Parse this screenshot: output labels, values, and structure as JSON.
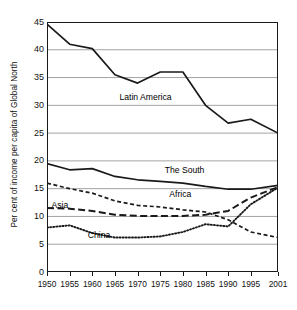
{
  "chart_data": {
    "type": "line",
    "title": "",
    "xlabel": "",
    "ylabel": "Per cent of income per capita of Global North",
    "x": [
      1950,
      1955,
      1960,
      1965,
      1970,
      1975,
      1980,
      1985,
      1990,
      1995,
      2001
    ],
    "xtick_labels": [
      "1950",
      "1955",
      "1960",
      "1965",
      "1970",
      "1975",
      "1980",
      "1985",
      "1990",
      "1995",
      "2001"
    ],
    "ytick_labels": [
      "0",
      "5",
      "10",
      "15",
      "20",
      "25",
      "30",
      "35",
      "40",
      "45"
    ],
    "yticks": [
      0,
      5,
      10,
      15,
      20,
      25,
      30,
      35,
      40,
      45
    ],
    "xlim": [
      1950,
      2001
    ],
    "ylim": [
      0,
      45
    ],
    "grid": "horizontal",
    "legend": "inline-labels",
    "series": [
      {
        "name": "Latin America",
        "style": "solid",
        "label_x": 1966,
        "label_y": 31.5,
        "values": [
          44.6,
          41.0,
          40.2,
          35.5,
          34.0,
          36.0,
          36.0,
          30.0,
          26.8,
          27.5,
          25.0
        ]
      },
      {
        "name": "The South",
        "style": "solid",
        "label_x": 1976,
        "label_y": 18.4,
        "values": [
          19.5,
          18.4,
          18.6,
          17.2,
          16.6,
          16.3,
          16.0,
          15.4,
          14.9,
          14.9,
          15.6
        ]
      },
      {
        "name": "Africa",
        "style": "short-dash",
        "label_x": 1977,
        "label_y": 14.0,
        "values": [
          16.0,
          15.0,
          14.2,
          12.8,
          12.0,
          11.7,
          11.2,
          10.8,
          9.4,
          7.2,
          6.2
        ]
      },
      {
        "name": "Asia",
        "style": "long-dash",
        "label_x": 1951,
        "label_y": 12.1,
        "values": [
          11.5,
          11.4,
          11.0,
          10.3,
          10.1,
          10.1,
          10.1,
          10.3,
          11.0,
          13.4,
          15.3
        ]
      },
      {
        "name": "China",
        "style": "dotted",
        "label_x": 1959,
        "label_y": 6.6,
        "values": [
          8.0,
          8.4,
          7.0,
          6.2,
          6.2,
          6.4,
          7.2,
          8.6,
          8.2,
          12.2,
          15.2
        ]
      }
    ]
  }
}
